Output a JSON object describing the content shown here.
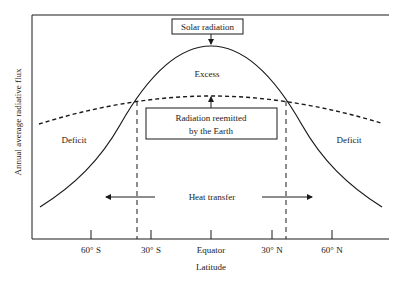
{
  "diagram": {
    "title": "",
    "y_axis_label": "Annual average radiative flux",
    "x_axis_label": "Latitude",
    "x_ticks": [
      "60° S",
      "30° S",
      "Equator",
      "30° N",
      "60° N"
    ],
    "boxes": {
      "solar": "Solar radiation",
      "reemitted_line1": "Radiation reemitted",
      "reemitted_line2": "by the Earth"
    },
    "regions": {
      "excess": "Excess",
      "deficit_left": "Deficit",
      "deficit_right": "Deficit"
    },
    "heat_transfer": "Heat transfer",
    "curves": [
      {
        "name": "Solar radiation absorbed",
        "style": "solid"
      },
      {
        "name": "Radiation reemitted by the Earth",
        "style": "dashed"
      }
    ],
    "crossover_markers": [
      "~37° S",
      "~37° N"
    ]
  }
}
